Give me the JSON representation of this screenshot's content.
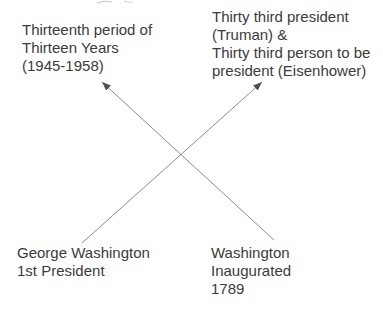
{
  "diagram": {
    "background_color": "#ffffff",
    "text_color": "#3b3b3b",
    "arrow_line_color": "#8c8c8c",
    "arrowhead_color": "#4f4f4f",
    "labels": {
      "top_left": {
        "lines": [
          "Thirteenth period of",
          "Thirteen Years",
          "(1945-1958)"
        ]
      },
      "top_right": {
        "lines": [
          "Thirty third president",
          "(Truman) &",
          "Thirty third person to be",
          "president (Eisenhower)"
        ]
      },
      "bottom_left": {
        "lines": [
          "George Washington",
          "1st President"
        ]
      },
      "bottom_right": {
        "lines": [
          "Washington",
          "Inaugurated",
          "1789"
        ]
      }
    },
    "arrows": [
      {
        "from": "bottom-left-label",
        "to": "top-right-label",
        "x1": 82,
        "y1": 243,
        "x2": 262,
        "y2": 82
      },
      {
        "from": "bottom-right-label",
        "to": "top-left-label",
        "x1": 274,
        "y1": 240,
        "x2": 102,
        "y2": 82
      }
    ]
  }
}
